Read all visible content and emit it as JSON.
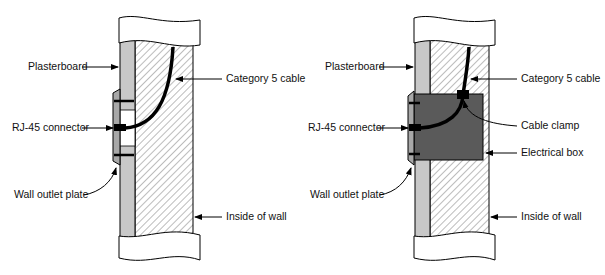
{
  "figure": {
    "left_panel": {
      "labels": {
        "plasterboard": "Plasterboard",
        "category5": "Category 5 cable",
        "rj45": "RJ-45 connector",
        "wall_outlet": "Wall outlet plate",
        "inside_wall": "Inside of wall"
      }
    },
    "right_panel": {
      "labels": {
        "plasterboard": "Plasterboard",
        "category5": "Category 5 cable",
        "cable_clamp": "Cable clamp",
        "rj45": "RJ-45 connector",
        "electrical_box": "Electrical box",
        "wall_outlet": "Wall outlet plate",
        "inside_wall": "Inside of wall"
      }
    },
    "colors": {
      "plasterboard": "#c8c8c8",
      "electrical_box": "#5a5a5a",
      "cable": "#000000",
      "hatch": "#555555"
    }
  }
}
